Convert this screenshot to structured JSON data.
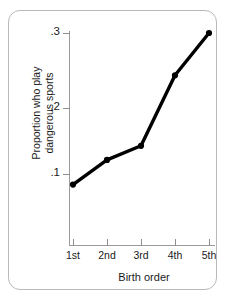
{
  "chart_data": {
    "type": "line",
    "title": "",
    "xlabel": "Birth order",
    "ylabel": "Proportion who play dangerous sports",
    "ylabel_line1": "Proportion who play",
    "ylabel_line2": "dangerous sports",
    "categories": [
      "1st",
      "2nd",
      "3rd",
      "4th",
      "5th"
    ],
    "values": [
      0.085,
      0.12,
      0.14,
      0.24,
      0.3
    ],
    "y_ticks": [
      0.1,
      0.2,
      0.3
    ],
    "y_tick_labels": [
      ".1",
      ".2",
      ".3"
    ],
    "ylim": [
      0.0,
      0.32
    ],
    "grid": false,
    "legend": null,
    "marker": "circle",
    "line_color": "#000000",
    "axis_color": "#9a9a9a",
    "frame_color": "#b9b9b9"
  },
  "axis": {
    "y_label_1": ".1",
    "y_label_2": ".2",
    "y_label_3": ".3",
    "x_label_1": "1st",
    "x_label_2": "2nd",
    "x_label_3": "3rd",
    "x_label_4": "4th",
    "x_label_5": "5th",
    "x_title": "Birth order",
    "y_title_line1": "Proportion who play",
    "y_title_line2": "dangerous sports"
  }
}
